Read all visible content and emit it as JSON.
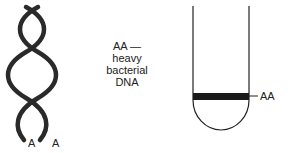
{
  "helix": {
    "strand_labels": [
      "A",
      "A"
    ]
  },
  "caption": {
    "line1": "AA —",
    "line2": "heavy",
    "line3": "bacterial",
    "line4": "DNA"
  },
  "tube": {
    "band_label": "AA"
  }
}
